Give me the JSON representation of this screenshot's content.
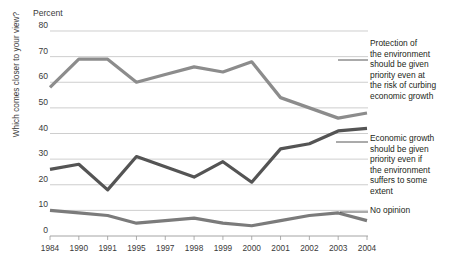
{
  "chart_data": {
    "type": "line",
    "title": "",
    "subtitle": "",
    "ylabel": "Percent",
    "xlabel": "",
    "axis_question": "Which comes closer to your view?",
    "categories": [
      "1984",
      "1990",
      "1991",
      "1995",
      "1997",
      "1998",
      "1999",
      "2000",
      "2001",
      "2002",
      "2003",
      "2004"
    ],
    "ylim": [
      0,
      80
    ],
    "ytick_labels": [
      "0",
      "10",
      "20",
      "30",
      "40",
      "50",
      "60",
      "70",
      "80"
    ],
    "ytick_values": [
      0,
      10,
      20,
      30,
      40,
      50,
      60,
      70,
      80
    ],
    "grid": true,
    "legend_position": "right-inline-labels",
    "series": [
      {
        "name": "Protection of the environment should be given priority even at the risk of curbing economic growth",
        "color": "#8c8c8c",
        "values": [
          58,
          69,
          69,
          60,
          63,
          66,
          64,
          68,
          54,
          50,
          46,
          48
        ]
      },
      {
        "name": "Economic growth should be given priority even if the environment suffers to some extent",
        "color": "#545454",
        "values": [
          26,
          28,
          18,
          31,
          27,
          23,
          29,
          21,
          34,
          36,
          41,
          42
        ]
      },
      {
        "name": "No opinion",
        "color": "#7b7b7b",
        "values": [
          10,
          9,
          8,
          5,
          6,
          7,
          5,
          4,
          6,
          8,
          9,
          6
        ]
      }
    ]
  },
  "legend": {
    "items": [
      {
        "label": "Protection of\nthe environment\nshould be given\npriority even at\nthe risk of curbing\neconomic growth"
      },
      {
        "label": "Economic growth\nshould be given\npriority even if\nthe environment\nsuffers to some\nextent"
      },
      {
        "label": "No opinion"
      }
    ],
    "line_0": "Protection of",
    "line_1": "the environment",
    "line_2": "should be given",
    "line_3": "priority even at",
    "line_4": "the risk of curbing",
    "line_5": "economic growth",
    "line_6": "Economic growth",
    "line_7": "should be given",
    "line_8": "priority even if",
    "line_9": "the environment",
    "line_10": "suffers to some",
    "line_11": "extent",
    "line_12": "No opinion"
  },
  "axes": {
    "ylabel": "Percent",
    "question": "Which comes closer to your view?"
  }
}
